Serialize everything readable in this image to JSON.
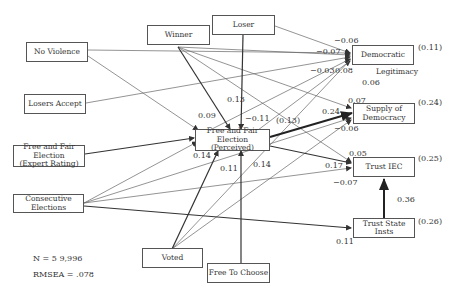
{
  "nodes": {
    "winner": "Winner",
    "loser": "Loser",
    "no_violence": "No Violence",
    "losers_accept": "Losers Accept",
    "ffe_expert_l1": "Free and Fair Election",
    "ffe_expert_l2": "(Expert Rating)",
    "consecutive": "Consecutive Elections",
    "ffe_perceived_l1": "Free and Fair Election",
    "ffe_perceived_l2": "(Perceived)",
    "voted": "Voted",
    "free_to_choose": "Free To Choose",
    "democratic": "Democratic",
    "legitimacy": "Legitimacy",
    "supply_l1": "Supply of",
    "supply_l2": "Democracy",
    "trust_iec": "Trust IEC",
    "trust_state": "Trust State Insts"
  },
  "r_squared": {
    "democratic": "(0.11)",
    "supply": "(0.24)",
    "trust_iec": "(0.25)",
    "trust_state": "(0.26)",
    "ffe_perceived": "(0.13)"
  },
  "coefficients": {
    "loser_democratic": "−0.06",
    "noviolence_democratic": "−0.07",
    "winner_democratic": "−0.03",
    "ffe_democratic": "0.08",
    "supply_dem": "0.06",
    "noviolence_ffe": "0.09",
    "winner_ffe": "0.13",
    "loser_ffe": "−0.11",
    "winner_supply": "0.07",
    "ffe_supply": "0.24",
    "other_supply": "−0.06",
    "expert_ffe": "0.14",
    "voted_ffe": "0.11",
    "choose_ffe": "0.14",
    "winner_iec": "0.05",
    "cons_iec": "0.17",
    "other_iec": "−0.07",
    "state_iec": "0.36",
    "cons_state": "0.11"
  },
  "stats": {
    "n": "N = 5 9,996",
    "rmsea": "RMSEA = .078"
  }
}
